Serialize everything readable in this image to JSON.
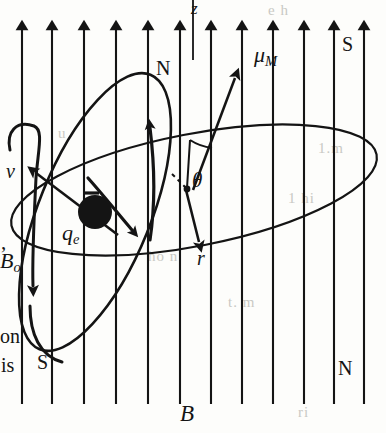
{
  "figure": {
    "kind": "physics-diagram",
    "background_color": "#fdfdfb",
    "ink_color": "#141414",
    "field": {
      "name": "uniform-magnetic-field",
      "label": "B",
      "arrow_count": 12,
      "arrow_direction": "up",
      "arrow_x_positions": [
        22,
        52,
        84,
        116,
        148,
        180,
        211,
        242,
        273,
        304,
        334,
        364
      ],
      "arrow_top_y": 16,
      "arrow_bottom_y": 404
    },
    "axis": {
      "name": "z-axis",
      "label": "z",
      "x": 193,
      "top_y": 0,
      "bottom_y": 60
    },
    "electron": {
      "name": "orbiting-charge",
      "label": "q",
      "label_sub": "e",
      "center_x": 95,
      "center_y": 212,
      "radius": 17,
      "sign_mark": "-"
    },
    "vectors": [
      {
        "name": "magnetic-moment",
        "label": "μ",
        "label_sub": "M",
        "from": [
          193,
          188
        ],
        "to": [
          240,
          72
        ]
      },
      {
        "name": "radius-vector",
        "label": "r",
        "from": [
          185,
          188
        ],
        "to": [
          201,
          248
        ]
      },
      {
        "name": "velocity-vector",
        "label": "v",
        "from": [
          110,
          228
        ],
        "to": [
          40,
          176
        ]
      },
      {
        "name": "precession-vector",
        "label": "B",
        "label_sub": "o",
        "from": [
          36,
          146
        ],
        "to": [
          35,
          300
        ]
      }
    ],
    "angle": {
      "name": "theta-angle",
      "label": "θ",
      "vertex": [
        188,
        188
      ],
      "x": 195,
      "y": 175
    },
    "poles": [
      {
        "name": "pole-orbit-north",
        "label": "N",
        "x": 159,
        "y": 62
      },
      {
        "name": "pole-orbit-south",
        "label": "S",
        "x": 40,
        "y": 356
      },
      {
        "name": "pole-field-south",
        "label": "S",
        "x": 344,
        "y": 38
      },
      {
        "name": "pole-field-north",
        "label": "N",
        "x": 340,
        "y": 363
      }
    ],
    "field_label": {
      "name": "field-label",
      "label": "B",
      "x": 182,
      "y": 404
    },
    "precession_ellipse": {
      "name": "precession-cone-ellipse",
      "cx": 194,
      "cy": 190,
      "rx": 186,
      "ry": 56,
      "rotation": -11
    },
    "orbit_ellipse": {
      "name": "electron-orbit-ellipse",
      "cx": 95,
      "cy": 212,
      "rx": 56,
      "ry": 148,
      "rotation": 22
    },
    "page_text_fragments": [
      {
        "name": "page-text-comma",
        "text": ",",
        "x": 2,
        "y": 246
      },
      {
        "name": "page-text-bo",
        "text": "B",
        "sub": "o",
        "x": 2,
        "y": 262
      },
      {
        "name": "page-text-on",
        "text": "on",
        "x": 1,
        "y": 336
      },
      {
        "name": "page-text-is",
        "text": "is",
        "x": 2,
        "y": 364
      }
    ],
    "bleed_through": [
      {
        "text": "e h",
        "x": 268,
        "y": 8
      },
      {
        "text": "1.m",
        "x": 320,
        "y": 148
      },
      {
        "text": "u",
        "x": 60,
        "y": 132
      },
      {
        "text": "1 hi",
        "x": 290,
        "y": 196
      },
      {
        "text": "ho  n",
        "x": 150,
        "y": 255
      },
      {
        "text": "t. m",
        "x": 230,
        "y": 300
      },
      {
        "text": "ri",
        "x": 300,
        "y": 410
      }
    ]
  }
}
